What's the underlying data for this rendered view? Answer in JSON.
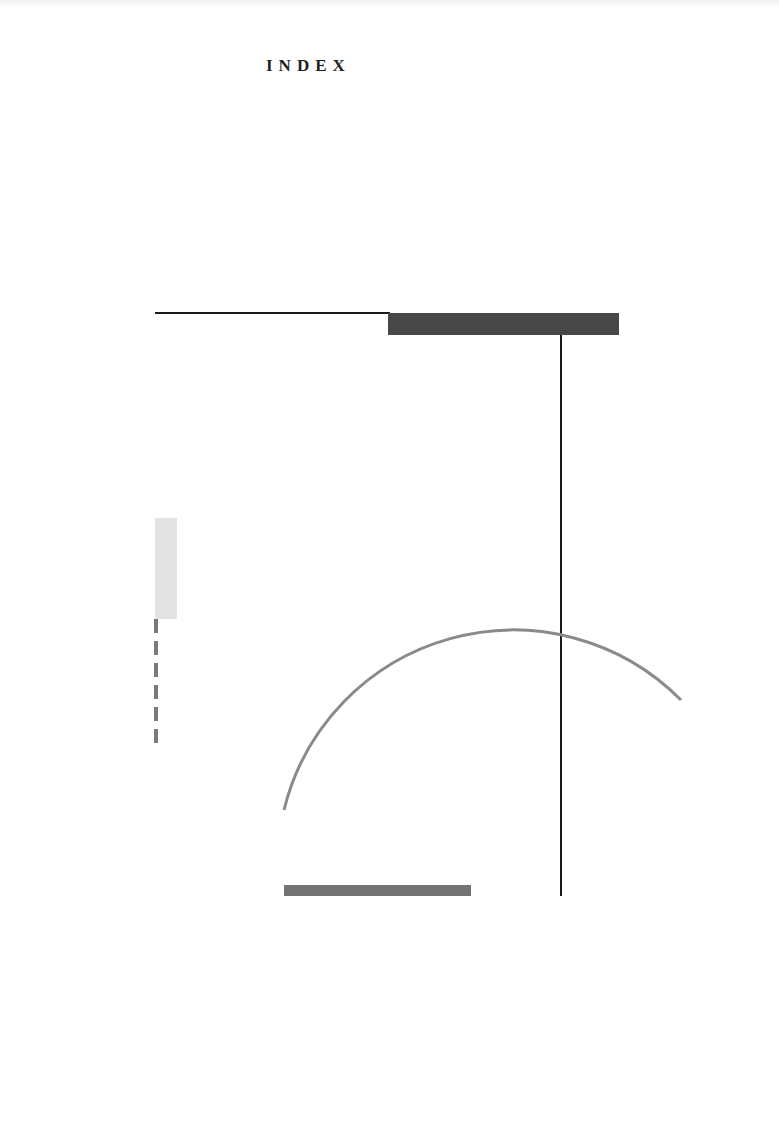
{
  "page": {
    "title": "INDEX",
    "background": "#ffffff"
  },
  "composition": {
    "shapes": [
      {
        "name": "top-horizontal-line",
        "type": "line",
        "color": "#1a1a1a",
        "x1": 155,
        "y1": 313,
        "x2": 390,
        "y2": 313
      },
      {
        "name": "dark-bar",
        "type": "rect",
        "color": "#474747",
        "x": 388,
        "y": 313,
        "w": 231,
        "h": 22
      },
      {
        "name": "vertical-line",
        "type": "line",
        "color": "#1a1a1a",
        "x1": 561,
        "y1": 335,
        "x2": 561,
        "y2": 896
      },
      {
        "name": "light-gray-rect",
        "type": "rect",
        "color": "#e3e3e3",
        "x": 155,
        "y": 518,
        "w": 22,
        "h": 101
      },
      {
        "name": "dashed-line",
        "type": "dashed-line",
        "color": "#7a7a7a",
        "x": 156,
        "y1": 619,
        "y2": 746,
        "dash": 14,
        "gap": 8
      },
      {
        "name": "arc",
        "type": "arc",
        "color": "#8a8a8a",
        "cx": 512,
        "cy": 866,
        "r": 236,
        "start": [
          284,
          810
        ],
        "end": [
          681,
          700
        ],
        "stroke_width": 3
      },
      {
        "name": "bottom-bar",
        "type": "rect",
        "color": "#737373",
        "x": 284,
        "y": 885,
        "w": 187,
        "h": 11
      }
    ]
  }
}
